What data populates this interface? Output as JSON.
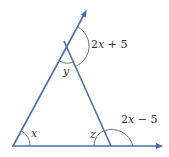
{
  "diagram": {
    "type": "triangle-exterior-angles",
    "colors": {
      "line": "#4a6fa5",
      "arc": "#666666",
      "text": "#333333"
    },
    "labels": {
      "angle_x": "x",
      "angle_y": "y",
      "angle_z": "z",
      "exterior_top": "2x + 5",
      "exterior_right": "2x − 5"
    }
  }
}
